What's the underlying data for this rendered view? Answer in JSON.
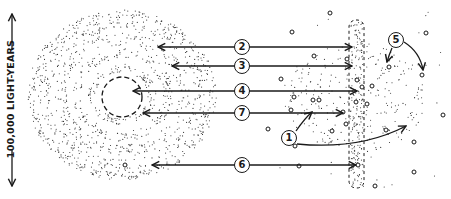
{
  "diagram": {
    "scale_label": "100,000 LIGHT-YEARS",
    "colors": {
      "ink": "#1a1a1a",
      "background": "#ffffff"
    },
    "labels": [
      {
        "id": "1",
        "text": "1",
        "x": 289,
        "y": 138
      },
      {
        "id": "2",
        "text": "2",
        "x": 242,
        "y": 47
      },
      {
        "id": "3",
        "text": "3",
        "x": 242,
        "y": 66
      },
      {
        "id": "4",
        "text": "4",
        "x": 242,
        "y": 91
      },
      {
        "id": "5",
        "text": "5",
        "x": 396,
        "y": 40
      },
      {
        "id": "6",
        "text": "6",
        "x": 242,
        "y": 165
      },
      {
        "id": "7",
        "text": "7",
        "x": 242,
        "y": 113
      }
    ],
    "arrows": [
      {
        "label": "2",
        "y": 47,
        "x_left": 158,
        "x_right": 352
      },
      {
        "label": "3",
        "y": 66,
        "x_left": 172,
        "x_right": 352
      },
      {
        "label": "4",
        "y": 91,
        "x_left": 133,
        "x_right": 357
      },
      {
        "label": "7",
        "y": 113,
        "x_left": 143,
        "x_right": 343
      },
      {
        "label": "6",
        "y": 165,
        "x_left": 152,
        "x_right": 356
      }
    ],
    "elements": {
      "galaxy_disc": "concentric dotted spiral rings",
      "core": "dashed circle",
      "edge_on_bar": "dashed vertical band of stars",
      "scattered_clusters": "small open circles"
    }
  }
}
